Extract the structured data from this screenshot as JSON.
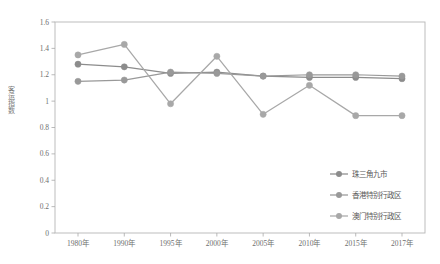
{
  "chart_data": {
    "type": "line",
    "title": "",
    "xlabel": "",
    "ylabel": "客运指数",
    "ylim": [
      0,
      1.6
    ],
    "ytick_step": 0.2,
    "grid": false,
    "legend_position": "inside-bottom-right",
    "categories": [
      "1980年",
      "1990年",
      "1995年",
      "2000年",
      "2005年",
      "2010年",
      "2015年",
      "2017年"
    ],
    "ytick_labels": [
      "0",
      "0.2",
      "0.4",
      "0.6",
      "0.8",
      "1",
      "1.2",
      "1.4",
      "1.6"
    ],
    "ytick_values": [
      0,
      0.2,
      0.4,
      0.6,
      0.8,
      1.0,
      1.2,
      1.4,
      1.6
    ],
    "series": [
      {
        "name": "珠三角九市",
        "color": "#8c8c8c",
        "marker": "circle",
        "values": [
          1.28,
          1.26,
          1.21,
          1.22,
          1.19,
          1.18,
          1.18,
          1.17
        ]
      },
      {
        "name": "香港特别行政区",
        "color": "#999999",
        "marker": "circle",
        "values": [
          1.15,
          1.16,
          1.22,
          1.21,
          1.19,
          1.2,
          1.2,
          1.19
        ]
      },
      {
        "name": "澳门特别行政区",
        "color": "#a8a8a8",
        "marker": "circle",
        "values": [
          1.35,
          1.43,
          0.98,
          1.34,
          0.9,
          1.12,
          0.89,
          0.89
        ]
      }
    ]
  },
  "legend": {
    "items": [
      {
        "label": "珠三角九市",
        "color": "#8c8c8c"
      },
      {
        "label": "香港特别行政区",
        "color": "#999999"
      },
      {
        "label": "澳门特别行政区",
        "color": "#a8a8a8"
      }
    ]
  },
  "colors": {
    "frame": "#b6b6b6",
    "tick": "#a9a9a9",
    "text": "#6e6e6e",
    "background": "#ffffff"
  },
  "layout": {
    "plot_left": 55,
    "plot_right": 425,
    "plot_top": 22,
    "plot_bottom": 233,
    "first_x": 78,
    "last_x": 402
  }
}
